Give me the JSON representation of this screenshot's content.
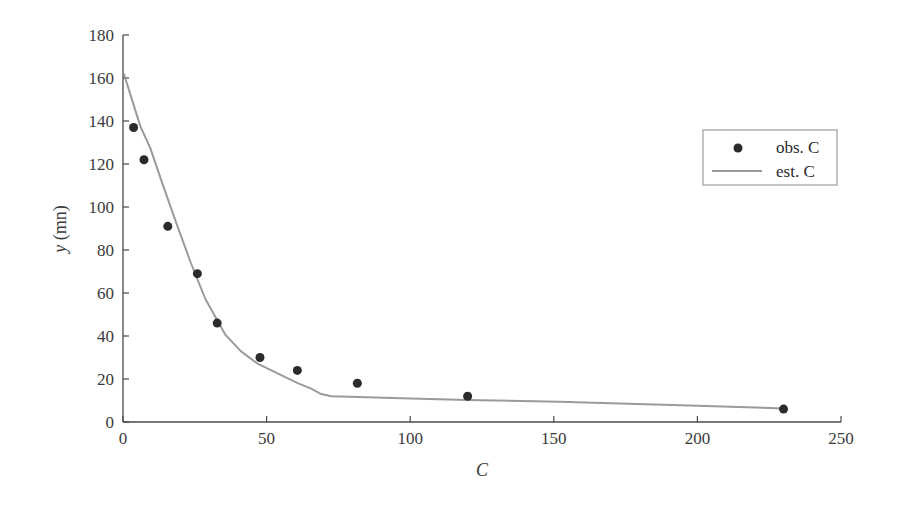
{
  "chart_data": {
    "type": "scatter",
    "title": "",
    "xlabel": "C",
    "ylabel_var": "y",
    "ylabel_unit": " (mn)",
    "ylabel": "y (mn)",
    "xlim": [
      0,
      250
    ],
    "ylim": [
      0,
      180
    ],
    "xticks": [
      0,
      50,
      100,
      150,
      200,
      250
    ],
    "yticks": [
      0,
      20,
      40,
      60,
      80,
      100,
      120,
      140,
      160,
      180
    ],
    "grid": false,
    "legend_position": "upper right",
    "series": [
      {
        "name": "obs. C",
        "kind": "scatter",
        "color": "#2b2b2b",
        "x": [
          3.7,
          7.3,
          15.6,
          25.9,
          32.8,
          47.7,
          60.7,
          81.6,
          120,
          230
        ],
        "y": [
          137,
          122,
          91,
          69,
          46,
          30,
          24,
          18,
          12,
          6
        ]
      },
      {
        "name": "est. C",
        "kind": "line",
        "color": "#9a9a9a",
        "x": [
          0.3,
          6,
          9.5,
          14,
          18.3,
          23.5,
          28.7,
          35.7,
          41,
          47,
          54,
          61,
          65.5,
          69,
          72.5,
          82,
          100,
          120,
          152,
          200,
          230
        ],
        "y": [
          162,
          137.7,
          127.4,
          109.8,
          93.5,
          74.4,
          57.2,
          40.5,
          33,
          27,
          22.5,
          18,
          15.5,
          13,
          12,
          11.6,
          11,
          10.3,
          9.4,
          7.6,
          6.3
        ]
      }
    ]
  },
  "legend": {
    "items": [
      {
        "label": "obs. C",
        "marker": "dot"
      },
      {
        "label": "est. C",
        "marker": "line"
      }
    ]
  }
}
